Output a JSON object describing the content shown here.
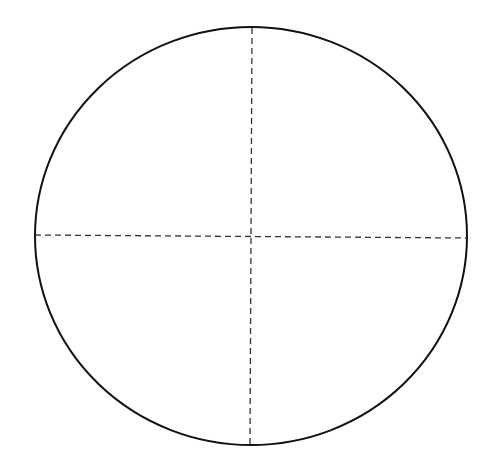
{
  "diagram": {
    "type": "circle-with-crosshairs",
    "background": "#ffffff",
    "circle": {
      "cx": 251,
      "cy": 236,
      "rx": 216,
      "ry": 209,
      "stroke": "#111111",
      "stroke_width": 2
    },
    "horizontal_axis": {
      "x1": 35,
      "y1": 235,
      "x2": 467,
      "y2": 238,
      "stroke": "#333333",
      "dash": "6,4"
    },
    "vertical_axis": {
      "x1": 252,
      "y1": 28,
      "x2": 250,
      "y2": 444,
      "stroke": "#333333",
      "dash": "6,4"
    }
  }
}
